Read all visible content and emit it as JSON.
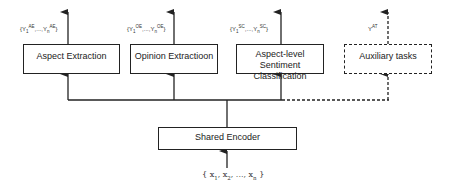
{
  "diagram": {
    "tasks": [
      {
        "id": "ae",
        "label": "Aspect Extraction",
        "output_prefix": "{Y",
        "sub1": "1",
        "sup1": "AE",
        "mid": ",...,Y",
        "subn": "n",
        "supn": "AE",
        "close": "}",
        "style": "solid"
      },
      {
        "id": "oe",
        "label": "Opinion Extractioon",
        "output_prefix": "{Y",
        "sub1": "1",
        "sup1": "OE",
        "mid": ",...,Y",
        "subn": "n",
        "supn": "OE",
        "close": "}",
        "style": "solid"
      },
      {
        "id": "sc",
        "label": "Aspect-level Sentiment Classification",
        "output_prefix": "{Y",
        "sub1": "1",
        "sup1": "SC",
        "mid": ",...,Y",
        "subn": "n",
        "supn": "SC",
        "close": "}",
        "style": "solid"
      },
      {
        "id": "at",
        "label": "Auxiliary tasks",
        "output_prefix": "Y",
        "sup1": "AT",
        "style": "dashed"
      }
    ],
    "encoder": {
      "label": "Shared Encoder"
    },
    "input": {
      "open": "{ x",
      "s1": "1",
      "c1": ", x",
      "s2": "2",
      "c2": ", ..., x",
      "sn": "n",
      "close": " }"
    }
  }
}
